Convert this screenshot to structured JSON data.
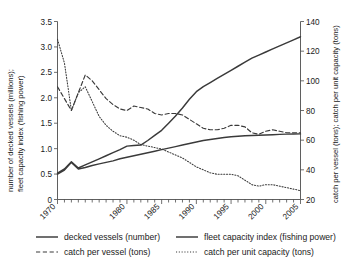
{
  "chart_data": {
    "type": "line",
    "title": "",
    "xlabel": "",
    "ylabel": "number of decked vessels (millions);\nfleet capacity index (fishing power)",
    "ylabel_line1": "number of decked vessels (millions);",
    "ylabel_line2": "fleet capacity index (fishing power)",
    "y2label": "catch per vessel (tons); catch per unit capacity (tons)",
    "grid": false,
    "legend_position": "bottom",
    "xlim": [
      1970,
      2005
    ],
    "ylim": [
      0,
      3.5
    ],
    "y2lim": [
      20,
      140
    ],
    "x_ticks_major": [
      1970,
      1980,
      1985,
      1990,
      1995,
      2000,
      2005
    ],
    "x_tick_labels": [
      "1970",
      "1980",
      "1985",
      "1990",
      "1995",
      "2000",
      "2005"
    ],
    "x_tick_minor_step": 1,
    "y_ticks": [
      0,
      0.5,
      1.0,
      1.5,
      2.0,
      2.5,
      3.0,
      3.5
    ],
    "y_tick_labels": [
      "0",
      "0.5",
      "1.0",
      "1.5",
      "2.0",
      "2.5",
      "3.0",
      "3.5"
    ],
    "y2_ticks": [
      20,
      40,
      60,
      80,
      100,
      120,
      140
    ],
    "y2_tick_labels": [
      "20",
      "40",
      "60",
      "80",
      "100",
      "120",
      "140"
    ],
    "x": [
      1970,
      1971,
      1972,
      1973,
      1974,
      1975,
      1976,
      1977,
      1978,
      1979,
      1980,
      1981,
      1982,
      1983,
      1984,
      1985,
      1986,
      1987,
      1988,
      1989,
      1990,
      1991,
      1992,
      1993,
      1994,
      1995,
      1996,
      1997,
      1998,
      1999,
      2000,
      2001,
      2002,
      2003,
      2004,
      2005
    ],
    "series": [
      {
        "name": "decked vessels (number)",
        "axis": "left",
        "style": "solid",
        "unit": "millions",
        "values": [
          0.5,
          0.58,
          0.73,
          0.6,
          0.63,
          0.67,
          0.7,
          0.73,
          0.76,
          0.8,
          0.83,
          0.86,
          0.89,
          0.92,
          0.95,
          0.98,
          1.01,
          1.04,
          1.07,
          1.1,
          1.13,
          1.16,
          1.18,
          1.2,
          1.22,
          1.235,
          1.245,
          1.255,
          1.26,
          1.265,
          1.27,
          1.275,
          1.28,
          1.285,
          1.288,
          1.29
        ]
      },
      {
        "name": "fleet capacity index (fishing power)",
        "axis": "left",
        "style": "solid",
        "unit": "index",
        "values": [
          0.52,
          0.6,
          0.74,
          0.62,
          0.68,
          0.74,
          0.8,
          0.86,
          0.92,
          0.98,
          1.05,
          1.06,
          1.07,
          1.16,
          1.26,
          1.36,
          1.5,
          1.64,
          1.8,
          1.97,
          2.12,
          2.22,
          2.3,
          2.38,
          2.46,
          2.54,
          2.62,
          2.7,
          2.78,
          2.84,
          2.9,
          2.96,
          3.02,
          3.08,
          3.14,
          3.2
        ]
      },
      {
        "name": "catch per vessel (tons)",
        "axis": "right",
        "style": "dashed",
        "unit": "tons",
        "values": [
          96,
          88,
          80,
          92,
          104,
          100,
          94,
          88,
          84,
          81,
          80,
          83,
          82,
          81,
          78,
          77,
          78,
          78,
          77,
          74,
          71,
          68,
          67,
          67,
          68,
          70,
          70,
          69,
          65,
          64,
          66,
          67,
          66,
          65,
          65,
          65
        ]
      },
      {
        "name": "catch per unit capacity (tons)",
        "axis": "right",
        "style": "dotted",
        "unit": "tons",
        "values": [
          128,
          112,
          80,
          92,
          96,
          86,
          76,
          70,
          66,
          63,
          62,
          60,
          57,
          56,
          55,
          54,
          52,
          50,
          48,
          45,
          42,
          40,
          38,
          37,
          37,
          37,
          36,
          33,
          30,
          29,
          30,
          30,
          29,
          28,
          27,
          26
        ]
      }
    ]
  },
  "legend": {
    "items": [
      {
        "label": "decked vessels (number)",
        "style": "solid"
      },
      {
        "label": "fleet capacity index (fishing power)",
        "style": "solid"
      },
      {
        "label": "catch per vessel (tons)",
        "style": "dashed"
      },
      {
        "label": "catch per unit capacity (tons)",
        "style": "dotted"
      }
    ]
  },
  "colors": {
    "ink": "#3a3a3a",
    "axis": "#4d4d4d",
    "background": "#ffffff"
  }
}
